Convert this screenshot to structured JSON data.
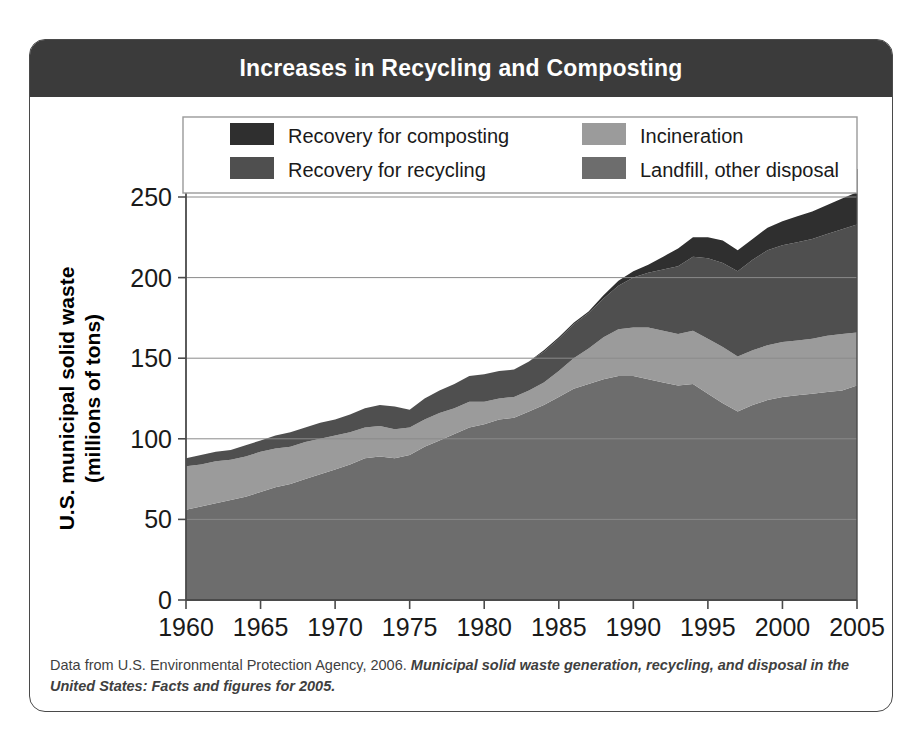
{
  "figure": {
    "title": "Increases in Recycling and Composting",
    "caption_plain": "Data from U.S. Environmental Protection Agency, 2006. ",
    "caption_emphasis": "Municipal solid waste generation, recycling, and disposal in the United States: Facts and figures for 2005."
  },
  "colors": {
    "header_bg": "#3b3b3b",
    "card_border": "#4a4a4a",
    "composting": "#2f2f2f",
    "recycling": "#4f4f4f",
    "incineration": "#9b9b9b",
    "landfill": "#6d6d6d",
    "gridline": "#8a8a8a",
    "axis": "#4a4a4a",
    "plot_bg": "#ffffff"
  },
  "chart_data": {
    "type": "area",
    "stacked": true,
    "title": "Increases in Recycling and Composting",
    "xlabel": "Year",
    "ylabel": "U.S. municipal solid waste (millions of tons)",
    "xlim": [
      1960,
      2005
    ],
    "ylim": [
      0,
      250
    ],
    "xticks": [
      1960,
      1965,
      1970,
      1975,
      1980,
      1985,
      1990,
      1995,
      2000,
      2005
    ],
    "yticks": [
      0,
      50,
      100,
      150,
      200,
      250
    ],
    "grid": "horizontal",
    "legend_position": "top-inside",
    "stack_order_bottom_to_top": [
      "Landfill, other disposal",
      "Incineration",
      "Recovery for recycling",
      "Recovery for composting"
    ],
    "x": [
      1960,
      1961,
      1962,
      1963,
      1964,
      1965,
      1966,
      1967,
      1968,
      1969,
      1970,
      1971,
      1972,
      1973,
      1974,
      1975,
      1976,
      1977,
      1978,
      1979,
      1980,
      1981,
      1982,
      1983,
      1984,
      1985,
      1986,
      1987,
      1988,
      1989,
      1990,
      1991,
      1992,
      1993,
      1994,
      1995,
      1996,
      1997,
      1998,
      1999,
      2000,
      2001,
      2002,
      2003,
      2004,
      2005
    ],
    "series": [
      {
        "name": "Landfill, other disposal",
        "color": "#6d6d6d",
        "values": [
          56,
          58,
          60,
          62,
          64,
          67,
          70,
          72,
          75,
          78,
          81,
          84,
          88,
          89,
          88,
          90,
          95,
          99,
          103,
          107,
          109,
          112,
          113,
          117,
          121,
          126,
          131,
          134,
          137,
          139,
          139,
          137,
          135,
          133,
          134,
          128,
          122,
          117,
          121,
          124,
          126,
          127,
          128,
          129,
          130,
          133
        ]
      },
      {
        "name": "Incineration",
        "color": "#9b9b9b",
        "values": [
          27,
          26,
          26,
          25,
          25,
          25,
          24,
          23,
          23,
          22,
          21,
          20,
          19,
          19,
          18,
          17,
          17,
          17,
          16,
          16,
          14,
          13,
          13,
          13,
          14,
          16,
          19,
          22,
          26,
          29,
          30,
          32,
          32,
          32,
          33,
          34,
          35,
          34,
          34,
          34,
          34,
          34,
          34,
          35,
          35,
          33
        ]
      },
      {
        "name": "Recovery for recycling",
        "color": "#4f4f4f",
        "values": [
          5,
          6,
          6,
          6,
          7,
          7,
          8,
          9,
          9,
          10,
          10,
          11,
          12,
          13,
          14,
          11,
          13,
          14,
          15,
          16,
          17,
          17,
          17,
          18,
          19,
          20,
          21,
          22,
          24,
          27,
          31,
          34,
          38,
          42,
          46,
          50,
          52,
          53,
          56,
          59,
          60,
          61,
          62,
          63,
          65,
          67
        ]
      },
      {
        "name": "Recovery for composting",
        "color": "#2f2f2f",
        "values": [
          0,
          0,
          0,
          0,
          0,
          0,
          0,
          0,
          0,
          0,
          0,
          0,
          0,
          0,
          0,
          0,
          0,
          0,
          0,
          0,
          0,
          0,
          0,
          0,
          1,
          1,
          1,
          1,
          2,
          3,
          4,
          5,
          8,
          11,
          12,
          13,
          14,
          13,
          13,
          14,
          15,
          16,
          17,
          18,
          19,
          20
        ]
      }
    ],
    "legend": [
      {
        "label": "Recovery for composting",
        "color": "#2f2f2f"
      },
      {
        "label": "Recovery for recycling",
        "color": "#4f4f4f"
      },
      {
        "label": "Incineration",
        "color": "#9b9b9b"
      },
      {
        "label": "Landfill, other disposal",
        "color": "#6d6d6d"
      }
    ]
  }
}
